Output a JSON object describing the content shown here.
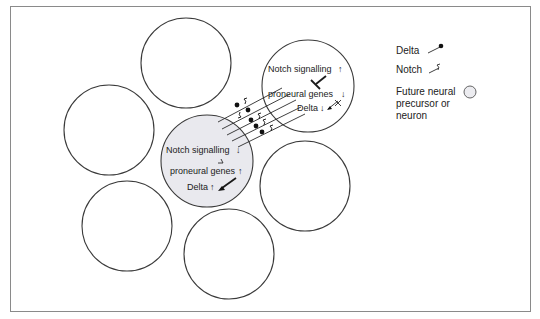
{
  "diagram": {
    "type": "lateral-inhibition-notch-delta",
    "cells": [
      {
        "id": "top",
        "cx": 186,
        "cy": 63,
        "r": 45,
        "highlight": false
      },
      {
        "id": "left",
        "cx": 109,
        "cy": 130,
        "r": 45,
        "highlight": false
      },
      {
        "id": "signal-receiving",
        "cx": 308,
        "cy": 86,
        "r": 46,
        "highlight": false
      },
      {
        "id": "signal-sending",
        "cx": 207,
        "cy": 161,
        "r": 46,
        "highlight": true
      },
      {
        "id": "right-middle",
        "cx": 305,
        "cy": 186,
        "r": 45,
        "highlight": false
      },
      {
        "id": "bottom-left",
        "cx": 127,
        "cy": 226,
        "r": 45,
        "highlight": false
      },
      {
        "id": "bottom",
        "cx": 229,
        "cy": 254,
        "r": 45,
        "highlight": false
      }
    ],
    "receiving_cell": {
      "notch_signalling": "Notch signalling",
      "notch_arrow": "↑",
      "proneural_genes": "proneural genes",
      "proneural_arrow": "↓",
      "delta": "Delta",
      "delta_arrow": "↓"
    },
    "sending_cell": {
      "notch_signalling": "Notch signalling",
      "notch_arrow": "↓",
      "proneural_genes": "proneural genes",
      "proneural_arrow": "↑",
      "delta": "Delta",
      "delta_arrow": "↑"
    },
    "legend": {
      "delta": "Delta",
      "notch": "Notch",
      "future_neural_line1": "Future neural",
      "future_neural_line2": "precursor or",
      "future_neural_line3": "neuron"
    },
    "colors": {
      "highlight_cell": "#e9e9ee",
      "stroke": "#3a3a3a",
      "frame": "#8a8a8a"
    }
  }
}
